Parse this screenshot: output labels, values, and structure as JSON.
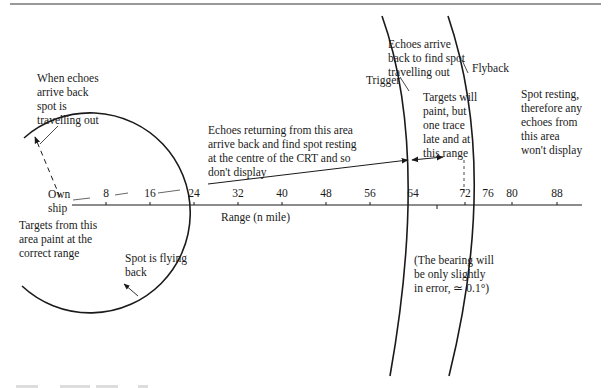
{
  "figure": {
    "axis": {
      "label": "Range (n mile)",
      "origin_label": "Own\nship",
      "ticks": [
        "8",
        "16",
        "24",
        "32",
        "40",
        "48",
        "56",
        "64",
        "72",
        "76",
        "80",
        "88"
      ]
    },
    "arcs": {
      "trigger_label": "Trigger",
      "flyback_label": "Flyback"
    },
    "annotations": {
      "when_echoes_arrive": "When echoes\narrive back\nspot is\ntravelling out",
      "targets_correct": "Targets from this\narea paint at the\ncorrect range",
      "spot_flying_back": "Spot is flying\nback",
      "echoes_returning": "Echoes returning from this area\narrive back and find spot resting\nat the centre of the CRT and so\ndon't display",
      "echoes_arrive_back": "Echoes arrive\nback to find spot\ntravelling out",
      "targets_will_paint": "Targets will\npaint, but\none trace\nlate and at\nthis range",
      "spot_resting": "Spot resting,\ntherefore any\nechoes from\nthis area\nwon't display",
      "bearing_error": "(The bearing will\nbe only slightly\nin error, ≃ 0.1°)"
    },
    "colors": {
      "ink": "#1a1a1a",
      "rule": "#777777"
    }
  }
}
